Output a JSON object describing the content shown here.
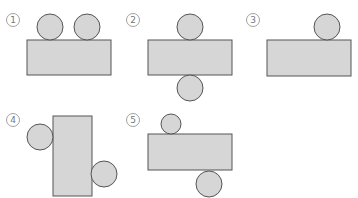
{
  "colors": {
    "shape_fill": "#d6d6d6",
    "shape_stroke": "#555555",
    "label": "#777777"
  },
  "figures": [
    {
      "label": "1",
      "rect": {
        "x": 27,
        "y": 40,
        "w": 84,
        "h": 35
      },
      "circles": [
        {
          "cx": 50,
          "cy": 27,
          "r": 13
        },
        {
          "cx": 87,
          "cy": 27,
          "r": 13
        }
      ],
      "label_pos": {
        "x": 13,
        "y": 20
      }
    },
    {
      "label": "2",
      "rect": {
        "x": 148,
        "y": 40,
        "w": 84,
        "h": 35
      },
      "circles": [
        {
          "cx": 190,
          "cy": 27,
          "r": 13
        },
        {
          "cx": 190,
          "cy": 88,
          "r": 13
        }
      ],
      "label_pos": {
        "x": 133,
        "y": 20
      }
    },
    {
      "label": "3",
      "rect": {
        "x": 267,
        "y": 40,
        "w": 84,
        "h": 36
      },
      "circles": [
        {
          "cx": 327,
          "cy": 27,
          "r": 13
        }
      ],
      "label_pos": {
        "x": 253,
        "y": 20
      }
    },
    {
      "label": "4",
      "rect": {
        "x": 53,
        "y": 116,
        "w": 39,
        "h": 80
      },
      "circles": [
        {
          "cx": 40,
          "cy": 137,
          "r": 13
        },
        {
          "cx": 104,
          "cy": 174,
          "r": 13
        }
      ],
      "label_pos": {
        "x": 13,
        "y": 120
      }
    },
    {
      "label": "5",
      "rect": {
        "x": 148,
        "y": 134,
        "w": 84,
        "h": 36
      },
      "circles": [
        {
          "cx": 171,
          "cy": 124,
          "r": 10
        },
        {
          "cx": 209,
          "cy": 184,
          "r": 13
        }
      ],
      "label_pos": {
        "x": 133,
        "y": 120
      }
    }
  ]
}
